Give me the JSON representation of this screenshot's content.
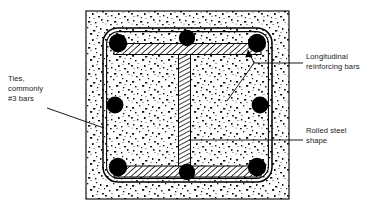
{
  "figure": {
    "colors": {
      "ink": "#000000",
      "concrete_fill": "#ffffff",
      "stipple": "#1a1a1a",
      "rebar": "#000000",
      "steel_hatch": "#000000"
    },
    "labels": {
      "longitudinal": "Longitudinal\nreinforcing bars",
      "ties": "Ties,\ncommonly\n#3 bars",
      "rolled": "Rolled steel\nshape"
    },
    "components": {
      "concrete_section": "concrete-column-section",
      "tie": "rectangular-tie",
      "steel_shape": "rolled-steel-i-shape",
      "rebar_count": 8,
      "rebar_positions": [
        "top-left",
        "top-center",
        "top-right",
        "mid-left",
        "mid-right",
        "bottom-left",
        "bottom-center",
        "bottom-right"
      ]
    }
  }
}
